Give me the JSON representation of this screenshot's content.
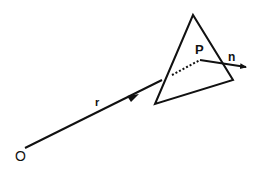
{
  "diagram": {
    "labels": {
      "origin": "O",
      "ray": "r",
      "point": "P",
      "normal": "n"
    },
    "colors": {
      "stroke": "#111111",
      "background": "#ffffff"
    }
  }
}
